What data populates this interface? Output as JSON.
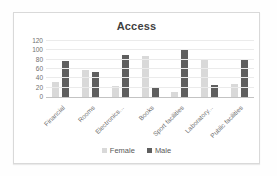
{
  "chart_data": {
    "type": "bar",
    "title": "Access",
    "categories": [
      "Financial",
      "Rooms",
      "Electronics...",
      "Books",
      "Sport facilities",
      "Laboratory...",
      "Public facilities"
    ],
    "series": [
      {
        "name": "Female",
        "color": "#d9d9d9",
        "values": [
          33,
          57,
          23,
          87,
          10,
          82,
          27
        ]
      },
      {
        "name": "Male",
        "color": "#5f5f5f",
        "values": [
          77,
          54,
          89,
          22,
          101,
          26,
          80
        ]
      }
    ],
    "xlabel": "",
    "ylabel": "",
    "ylim": [
      0,
      120
    ],
    "yticks": [
      0,
      20,
      40,
      60,
      80,
      100,
      120
    ],
    "grid": "horizontal",
    "legend_position": "bottom"
  },
  "colors": {
    "chart_border": "#d9d9d9",
    "gridline": "#ebebeb",
    "axis_line": "#c3c3c3",
    "tick_text": "#6f6f6f",
    "title_text": "#3f3f3f",
    "legend_text": "#595959",
    "background": "#ffffff"
  }
}
